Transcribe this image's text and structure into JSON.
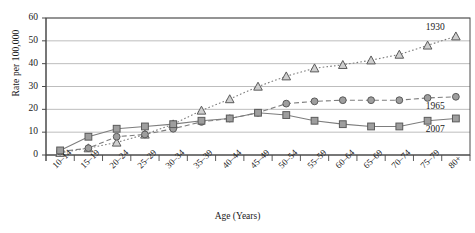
{
  "chart_data": {
    "type": "line",
    "title": "",
    "xlabel": "Age (Years)",
    "ylabel": "Rate per 100,000",
    "categories": [
      "10–14",
      "15–19",
      "20–24",
      "25–29",
      "30–34",
      "35–39",
      "40–44",
      "45–49",
      "50–54",
      "55–59",
      "60–64",
      "65–69",
      "70–74",
      "75–79",
      "80+"
    ],
    "ylim": [
      0,
      60
    ],
    "yticks": [
      0,
      10,
      20,
      30,
      40,
      50,
      60
    ],
    "grid": true,
    "legend_position": "inline-right",
    "series": [
      {
        "name": "1930",
        "marker": "triangle",
        "line_style": "dotted",
        "color": "#808080",
        "values": [
          1.0,
          3.0,
          5.5,
          9.0,
          13.5,
          19.5,
          24.5,
          30.0,
          34.5,
          38.0,
          39.5,
          41.5,
          44.0,
          48.0,
          52.0
        ]
      },
      {
        "name": "1965",
        "marker": "circle",
        "line_style": "dashed",
        "color": "#808080",
        "values": [
          1.5,
          3.0,
          8.0,
          9.0,
          11.5,
          14.5,
          16.0,
          18.5,
          22.5,
          23.5,
          24.0,
          24.0,
          24.0,
          25.0,
          25.5
        ]
      },
      {
        "name": "2007",
        "marker": "square",
        "line_style": "solid",
        "color": "#808080",
        "values": [
          2.0,
          8.0,
          11.5,
          12.5,
          13.5,
          15.0,
          16.0,
          18.5,
          17.5,
          15.0,
          13.5,
          12.5,
          12.5,
          15.0,
          16.0
        ]
      }
    ]
  },
  "axes": {
    "y_tick_labels": [
      "60",
      "50",
      "40",
      "30",
      "20",
      "10",
      "0"
    ],
    "ylabel_text": "Rate per 100,000",
    "xlabel_text": "Age (Years)"
  },
  "series_labels": [
    {
      "text": "1930"
    },
    {
      "text": "1965"
    },
    {
      "text": "2007"
    }
  ],
  "colors": {
    "line": "#7d7d7d",
    "grid": "#b5b5b5",
    "axis": "#555555",
    "marker_fill": "#9e9e9e",
    "marker_stroke": "#5a5a5a",
    "frame": "#4a4a4a"
  }
}
